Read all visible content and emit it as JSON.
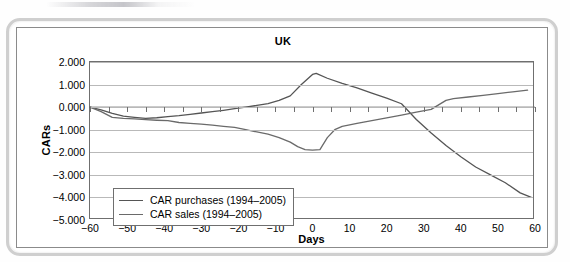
{
  "figure": {
    "title": "UK"
  },
  "chart_data": {
    "type": "line",
    "title": "UK",
    "xlabel": "Days",
    "ylabel": "CARs",
    "xlim": [
      -60,
      60
    ],
    "ylim": [
      -5.0,
      2.0
    ],
    "grid": true,
    "legend_position": "inside-lower-left",
    "x_ticks": [
      "−60",
      "−50",
      "−40",
      "−30",
      "−20",
      "−10",
      "0",
      "10",
      "20",
      "30",
      "40",
      "50",
      "60"
    ],
    "x_tick_values": [
      -60,
      -50,
      -40,
      -30,
      -20,
      -10,
      0,
      10,
      20,
      30,
      40,
      50,
      60
    ],
    "y_ticks": [
      "2.000",
      "1.000",
      "0.000",
      "−1.000",
      "−2.000",
      "−3.000",
      "−4.000",
      "−5.000"
    ],
    "y_tick_values": [
      2.0,
      1.0,
      0.0,
      -1.0,
      -2.0,
      -3.0,
      -4.0,
      -5.0
    ],
    "series": [
      {
        "name": "CAR purchases (1994–2005)",
        "color": "#555555",
        "x": [
          -60,
          -57,
          -54,
          -51,
          -48,
          -45,
          -42,
          -39,
          -36,
          -33,
          -30,
          -27,
          -24,
          -21,
          -18,
          -15,
          -12,
          -9,
          -6,
          -3,
          0,
          1,
          4,
          8,
          12,
          16,
          20,
          24,
          28,
          32,
          36,
          40,
          44,
          48,
          52,
          56,
          59
        ],
        "values": [
          0.0,
          -0.12,
          -0.28,
          -0.4,
          -0.45,
          -0.5,
          -0.47,
          -0.42,
          -0.38,
          -0.32,
          -0.26,
          -0.2,
          -0.14,
          -0.07,
          0.0,
          0.08,
          0.16,
          0.3,
          0.5,
          1.0,
          1.45,
          1.5,
          1.28,
          1.05,
          0.85,
          0.62,
          0.4,
          0.15,
          -0.55,
          -1.15,
          -1.7,
          -2.2,
          -2.65,
          -3.0,
          -3.35,
          -3.8,
          -4.0
        ]
      },
      {
        "name": "CAR sales (1994–2005)",
        "color": "#6a6a6a",
        "x": [
          -60,
          -57,
          -54,
          -51,
          -48,
          -45,
          -42,
          -39,
          -36,
          -33,
          -30,
          -27,
          -24,
          -21,
          -18,
          -15,
          -12,
          -9,
          -6,
          -4,
          -2,
          0,
          2,
          4,
          6,
          8,
          12,
          16,
          20,
          24,
          28,
          32,
          36,
          38,
          42,
          46,
          50,
          54,
          58
        ],
        "values": [
          0.0,
          -0.2,
          -0.45,
          -0.5,
          -0.52,
          -0.55,
          -0.58,
          -0.6,
          -0.68,
          -0.72,
          -0.75,
          -0.8,
          -0.85,
          -0.9,
          -1.0,
          -1.1,
          -1.2,
          -1.35,
          -1.55,
          -1.75,
          -1.88,
          -1.9,
          -1.88,
          -1.35,
          -1.0,
          -0.85,
          -0.72,
          -0.6,
          -0.48,
          -0.35,
          -0.22,
          -0.1,
          0.3,
          0.38,
          0.45,
          0.52,
          0.6,
          0.68,
          0.75
        ]
      }
    ]
  },
  "legend": {
    "items": [
      {
        "label": "CAR purchases (1994–2005)",
        "color": "#555555"
      },
      {
        "label": "CAR sales (1994–2005)",
        "color": "#6a6a6a"
      }
    ]
  }
}
